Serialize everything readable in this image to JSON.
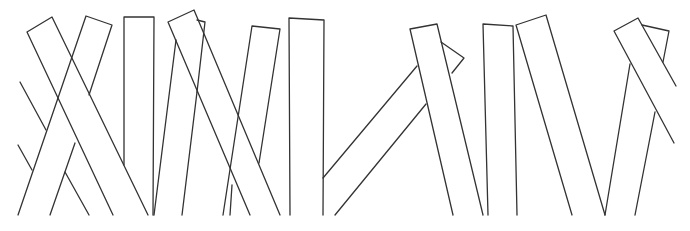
{
  "illustration": {
    "subject": "line drawing of leaning planks / book spines",
    "stroke_color": "#333333",
    "background_color": "#ffffff"
  }
}
